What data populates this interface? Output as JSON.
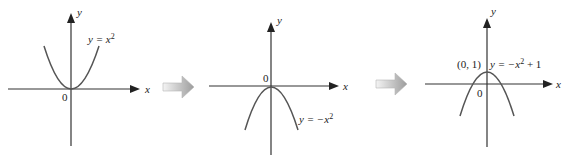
{
  "colors": {
    "line": "#333333",
    "curve": "#555555",
    "arrow_light": "#f2f2f2",
    "arrow_dark": "#9a9a9a"
  },
  "panels": [
    {
      "x_label": "x",
      "y_label": "y",
      "origin_label": "0",
      "equation_lhs": "y = ",
      "equation_rhs": "x",
      "equation_exp": "2",
      "equation_tail": ""
    },
    {
      "x_label": "x",
      "y_label": "y",
      "origin_label": "0",
      "equation_lhs": "y = ",
      "equation_rhs": "−x",
      "equation_exp": "2",
      "equation_tail": ""
    },
    {
      "x_label": "x",
      "y_label": "y",
      "origin_label": "0",
      "point_label": "(0, 1)",
      "equation_lhs": "y = ",
      "equation_rhs": "−x",
      "equation_exp": "2",
      "equation_tail": " + 1"
    }
  ],
  "transitions": [
    {
      "icon": "right-arrow-icon"
    },
    {
      "icon": "right-arrow-icon"
    }
  ]
}
